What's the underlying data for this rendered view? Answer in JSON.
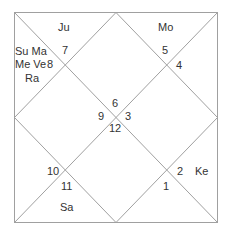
{
  "chart": {
    "style": "North Indian",
    "line_color": "#9a9a9a",
    "houses": [
      {
        "house": 1,
        "sign": "1",
        "planets": ""
      },
      {
        "house": 2,
        "sign": "12",
        "planets": ""
      },
      {
        "house": 3,
        "sign": "11",
        "planets": "Sa"
      },
      {
        "house": 4,
        "sign": "9",
        "planets": ""
      },
      {
        "house": 5,
        "sign": "10",
        "planets": ""
      },
      {
        "house": 6,
        "sign": "2",
        "planets": "Ke"
      },
      {
        "house": 7,
        "sign": "3",
        "planets": ""
      },
      {
        "house": 8,
        "sign": "6",
        "planets": ""
      },
      {
        "house": 9,
        "sign": "4",
        "planets": ""
      },
      {
        "house": 10,
        "sign": "5",
        "planets": "Mo"
      },
      {
        "house": 11,
        "sign": "7",
        "planets": "Ju"
      },
      {
        "house": 12,
        "sign": "8",
        "planets": "Su Ma Me Ve Ra"
      }
    ],
    "labels": {
      "n6": "6",
      "n9": "9",
      "n3": "3",
      "n12": "12",
      "n7": "7",
      "n8": "8",
      "n5": "5",
      "n4": "4",
      "n10": "10",
      "n11": "11",
      "n2": "2",
      "n1": "1",
      "ju": "Ju",
      "mo": "Mo",
      "sa": "Sa",
      "ke": "Ke",
      "left_line1": "Su Ma",
      "left_line2": "Me Ve",
      "left_line3": "Ra"
    }
  }
}
